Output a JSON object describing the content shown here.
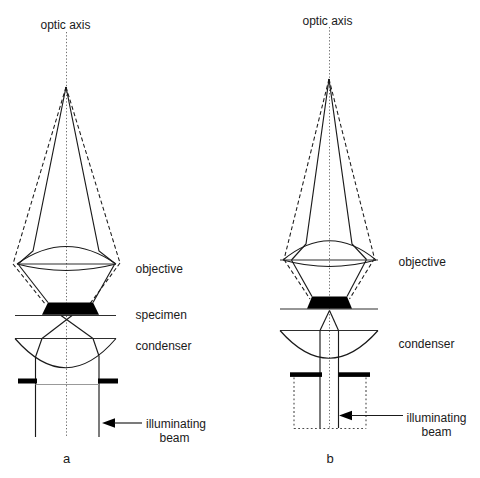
{
  "figure": {
    "type": "optical-microscope-illumination-diagram",
    "colors": {
      "ink": "#1a1a1a",
      "background": "#ffffff",
      "diaphragm_gray": "#999999"
    },
    "a": {
      "axis_label": "optic axis",
      "objective_label": "objective",
      "specimen_label": "specimen",
      "condenser_label": "condenser",
      "beam_label_line1": "illuminating",
      "beam_label_line2": "beam",
      "caption": "a"
    },
    "b": {
      "axis_label": "optic axis",
      "objective_label": "objective",
      "condenser_label": "condenser",
      "beam_label_line1": "illuminating",
      "beam_label_line2": "beam",
      "caption": "b"
    }
  }
}
